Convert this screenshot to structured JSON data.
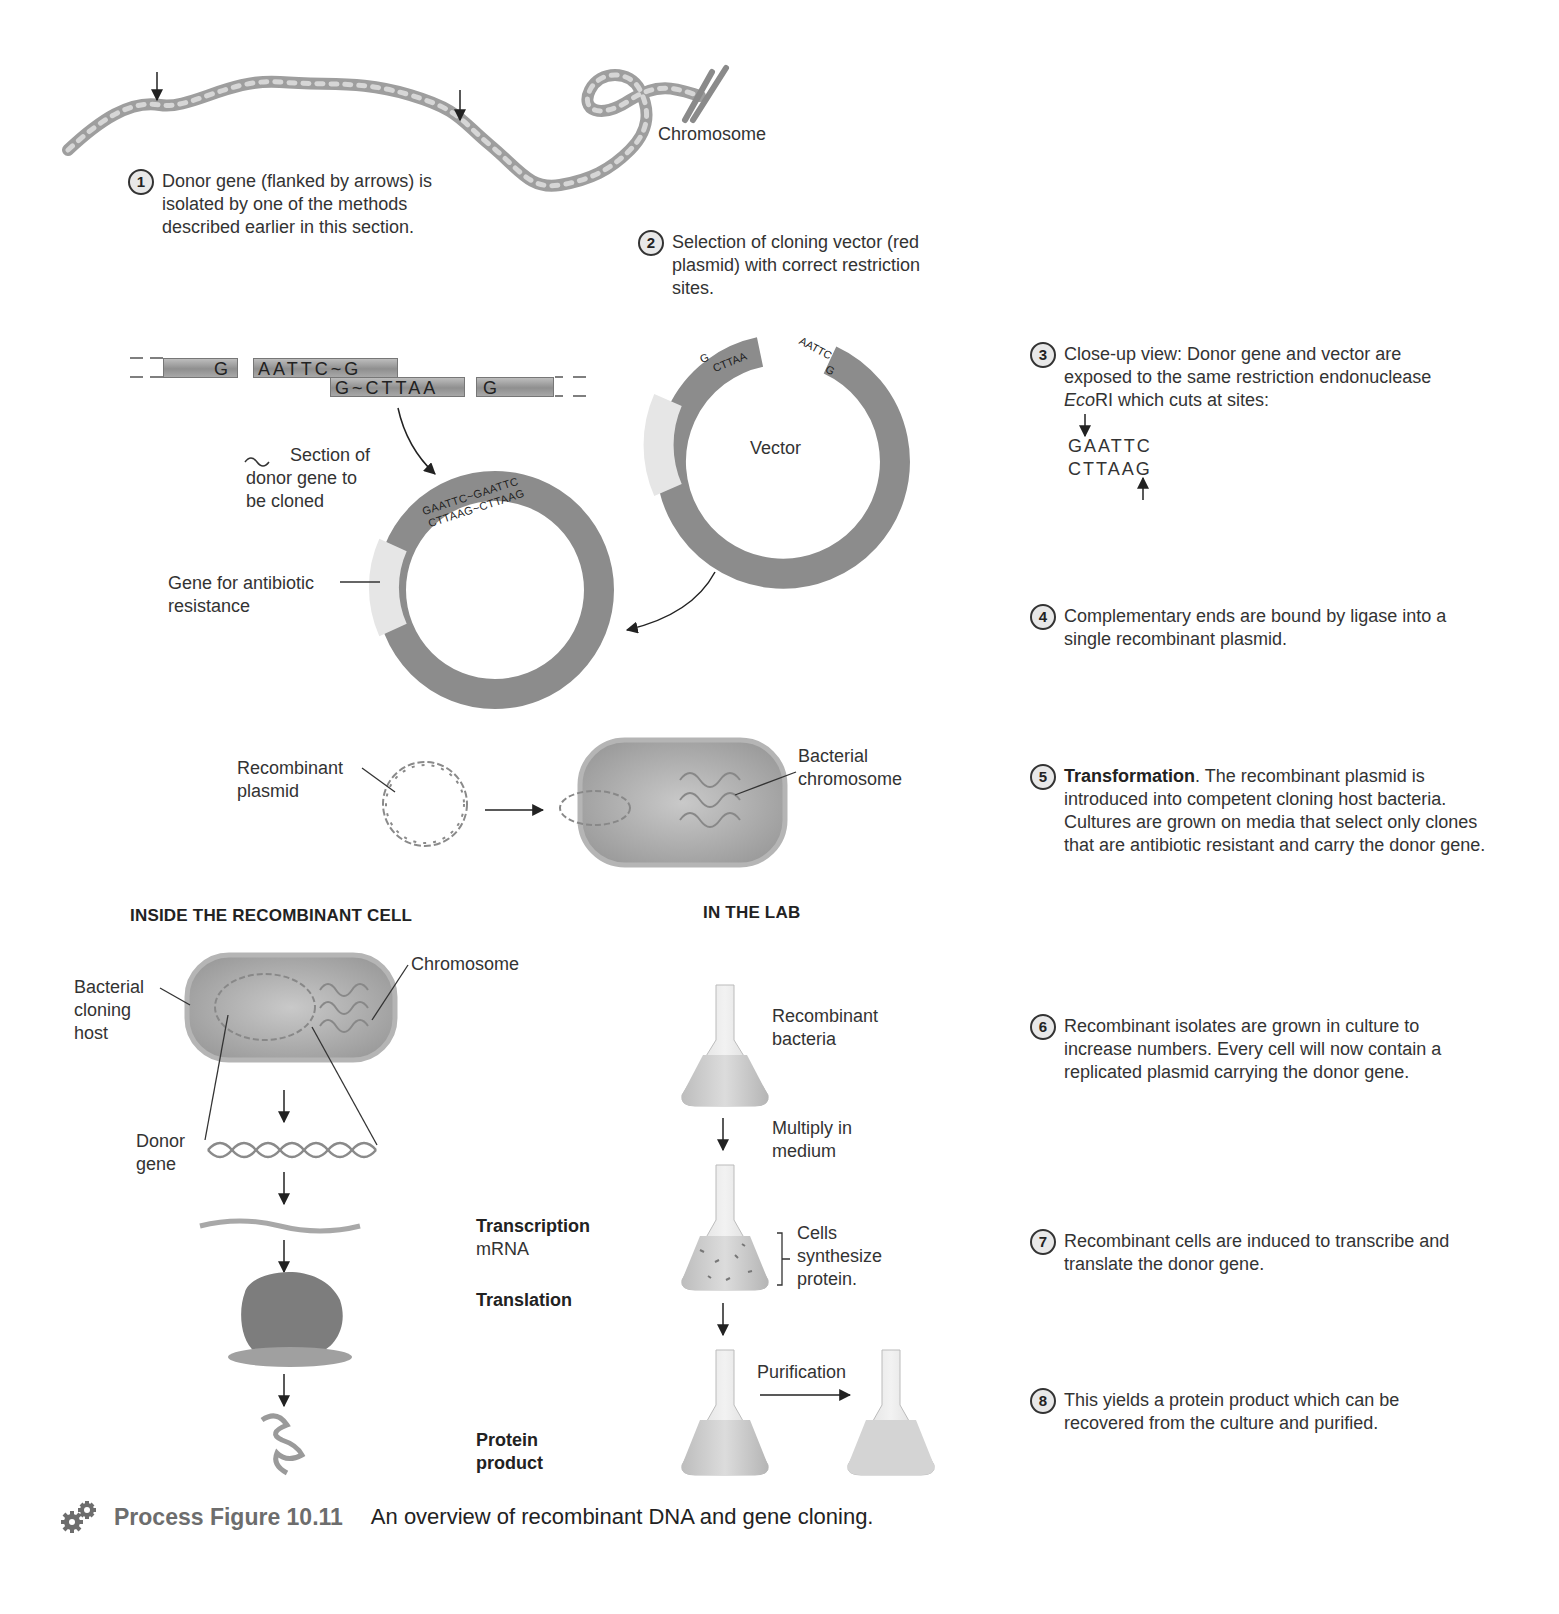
{
  "figure": {
    "label": "Process Figure 10.11",
    "caption": "An overview of recombinant DNA and gene cloning.",
    "icon": "gears-icon"
  },
  "labels": {
    "chromosome_top": "Chromosome",
    "vector": "Vector",
    "section_of_donor_gene": "Section of donor gene to be cloned",
    "section_line1": "Section of",
    "section_line2": "donor gene to",
    "section_line3": "be cloned",
    "antibiotic_line1": "Gene for antibiotic",
    "antibiotic_line2": "resistance",
    "recombinant_plasmid_line1": "Recombinant",
    "recombinant_plasmid_line2": "plasmid",
    "bacterial_chromosome_line1": "Bacterial",
    "bacterial_chromosome_line2": "chromosome",
    "cloning_host_line1": "Bacterial",
    "cloning_host_line2": "cloning",
    "cloning_host_line3": "host",
    "chromosome_cell": "Chromosome",
    "donor_gene_line1": "Donor",
    "donor_gene_line2": "gene",
    "transcription": "Transcription",
    "mrna": "mRNA",
    "translation": "Translation",
    "protein_line1": "Protein",
    "protein_line2": "product",
    "recombinant_bacteria_line1": "Recombinant",
    "recombinant_bacteria_line2": "bacteria",
    "multiply_line1": "Multiply in",
    "multiply_line2": "medium",
    "cells_line1": "Cells",
    "cells_line2": "synthesize",
    "cells_line3": "protein.",
    "purification": "Purification"
  },
  "sections": {
    "inside_cell": "INSIDE THE RECOMBINANT CELL",
    "in_the_lab": "IN THE LAB"
  },
  "sequences": {
    "donor_left_top": "G",
    "donor_mid_top": "AATTC~G",
    "donor_mid_bottom": "G~CTTAA",
    "donor_right_bottom": "G",
    "vector_left_top": "G",
    "vector_left_bottom": "CTTAA",
    "vector_right_top": "AATTC",
    "vector_right_bottom": "G",
    "recombinant_top": "GAATTC~GAATTC",
    "recombinant_bottom": "CTTAAG~CTTAAG",
    "ecori_top": "GAATTC",
    "ecori_bottom": "CTTAAG"
  },
  "steps": [
    {
      "n": "1",
      "text": "Donor gene (flanked by arrows) is isolated by one of the methods described earlier in this section."
    },
    {
      "n": "2",
      "text": "Selection of cloning vector (red plasmid) with correct restriction sites."
    },
    {
      "n": "3",
      "text_before": "Close-up view: Donor gene and vector are exposed to the same restriction endonuclease ",
      "text_italic": "Eco",
      "text_after": "RI which cuts at sites:"
    },
    {
      "n": "4",
      "text": "Complementary ends are bound by ligase into a single recombinant plasmid."
    },
    {
      "n": "5",
      "bold": "Transformation",
      "text": ". The recombinant plasmid is introduced into competent cloning host bacteria. Cultures are grown on media that select only clones that are antibiotic resistant and carry the donor gene."
    },
    {
      "n": "6",
      "text": "Recombinant isolates are grown in culture to increase numbers. Every cell will now contain a replicated plasmid carrying the donor gene."
    },
    {
      "n": "7",
      "text": "Recombinant cells are induced to transcribe and translate the donor gene."
    },
    {
      "n": "8",
      "text": "This yields a protein product which can be recovered from the culture and purified."
    }
  ],
  "colors": {
    "plasmid_gray": "#8c8c8c",
    "antibiotic_band": "#e6e6e6",
    "text": "#333333",
    "caption_label": "#6d6d6d"
  }
}
